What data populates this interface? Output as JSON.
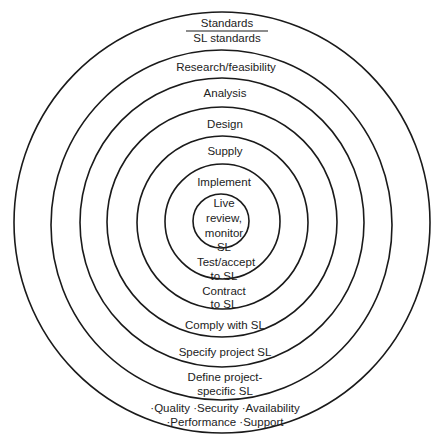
{
  "diagram": {
    "type": "concentric-circles",
    "colors": {
      "stroke": "#1a1a1a",
      "text": "#222222",
      "background": "#ffffff"
    },
    "top_header": {
      "primary": "Standards",
      "secondary": "SL standards"
    },
    "rings": [
      {
        "id": "ring-1",
        "top_labels": [
          "Live",
          "review,",
          "monitor",
          "SL"
        ],
        "bottom_labels": []
      },
      {
        "id": "ring-2",
        "top_labels": [
          "Implement"
        ],
        "bottom_labels": [
          "Test/accept",
          "to SL"
        ]
      },
      {
        "id": "ring-3",
        "top_labels": [
          "Supply"
        ],
        "bottom_labels": [
          "Contract",
          "to SL"
        ]
      },
      {
        "id": "ring-4",
        "top_labels": [
          "Design"
        ],
        "bottom_labels": [
          "Comply with SL"
        ]
      },
      {
        "id": "ring-5",
        "top_labels": [
          "Analysis"
        ],
        "bottom_labels": [
          "Specify project SL"
        ]
      },
      {
        "id": "ring-6",
        "top_labels": [
          "Research/feasibility"
        ],
        "bottom_labels": [
          "Define project-",
          "specific SL"
        ]
      },
      {
        "id": "ring-7",
        "top_labels": [],
        "bottom_labels": [
          "·Quality ·Security ·Availability",
          "·Performance ·Support"
        ]
      }
    ]
  }
}
